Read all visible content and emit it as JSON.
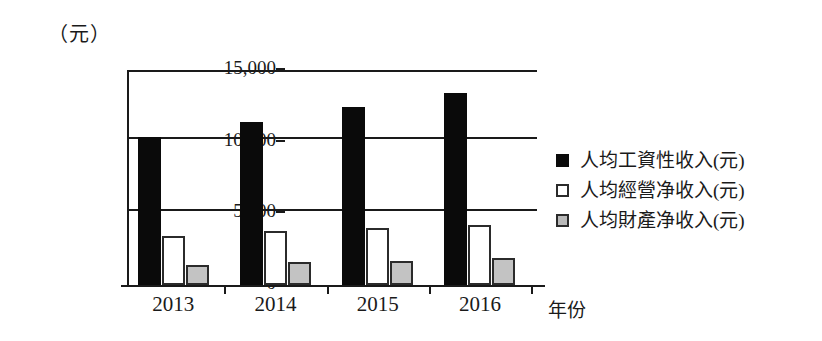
{
  "chart_data": {
    "type": "bar",
    "title": "",
    "unit_label": "（元）",
    "xlabel": "年份",
    "ylabel": "",
    "categories": [
      "2013",
      "2014",
      "2015",
      "2016"
    ],
    "ylim": [
      0,
      15000
    ],
    "yticks": [
      "0",
      "5,000",
      "10,000",
      "15,000"
    ],
    "ytick_values": [
      0,
      5000,
      10000,
      15000
    ],
    "grid": true,
    "legend_position": "right",
    "series": [
      {
        "name": "人均工資性收入(元)",
        "color": "#0a0a0a",
        "values": [
          10350,
          11400,
          12420,
          13400
        ]
      },
      {
        "name": "人均經營净收入(元)",
        "color": "#ffffff",
        "values": [
          3400,
          3750,
          3950,
          4220
        ]
      },
      {
        "name": "人均財產净收入(元)",
        "color": "#c3c3c3",
        "values": [
          1380,
          1580,
          1700,
          1870
        ]
      }
    ]
  }
}
